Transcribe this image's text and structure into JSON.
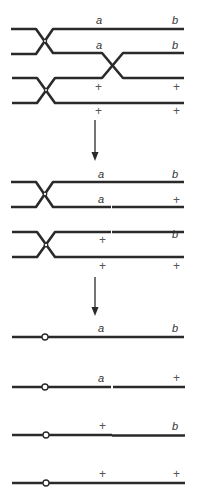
{
  "figure": {
    "colors": {
      "strand": "#2a2a2a",
      "label": "#333333",
      "background": "#ffffff"
    },
    "stage1": {
      "rows": [
        {
          "left_label": "a",
          "right_label": "b"
        },
        {
          "left_label": "a",
          "right_label": "b"
        },
        {
          "left_label": "+",
          "right_label": "+"
        },
        {
          "left_label": "+",
          "right_label": "+"
        }
      ]
    },
    "stage2": {
      "rows": [
        {
          "left_label": "a",
          "right_label": "b"
        },
        {
          "left_label": "a",
          "right_label": "+"
        },
        {
          "left_label": "+",
          "right_label": "b"
        },
        {
          "left_label": "+",
          "right_label": "+"
        }
      ]
    },
    "stage3": {
      "rows": [
        {
          "left_label": "a",
          "right_label": "b"
        },
        {
          "left_label": "a",
          "right_label": "+"
        },
        {
          "left_label": "+",
          "right_label": "b"
        },
        {
          "left_label": "+",
          "right_label": "+"
        }
      ]
    },
    "arrows": [
      {
        "direction": "down-arrow"
      },
      {
        "direction": "down-arrow"
      }
    ]
  }
}
